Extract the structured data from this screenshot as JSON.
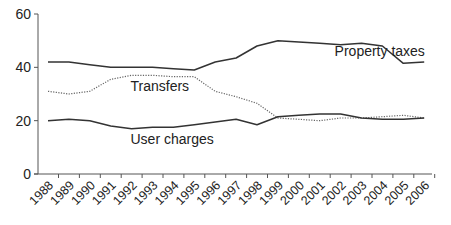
{
  "chart_data": {
    "type": "line",
    "title": "",
    "xlabel": "",
    "ylabel": "",
    "ylim": [
      0,
      60
    ],
    "yticks": [
      0,
      20,
      40,
      60
    ],
    "grid": false,
    "legend": "inline labels",
    "categories": [
      "1988",
      "1989",
      "1990",
      "1991",
      "1992",
      "1993",
      "1994",
      "1995",
      "1996",
      "1997",
      "1998",
      "1999",
      "2000",
      "2001",
      "2002",
      "2003",
      "2004",
      "2005",
      "2006"
    ],
    "series": [
      {
        "name": "Property taxes",
        "style": "solid",
        "values": [
          42,
          42,
          41,
          40,
          40,
          40,
          39.5,
          39,
          42,
          43.5,
          48,
          50,
          49.5,
          49,
          48.5,
          49,
          48,
          41.5,
          42
        ]
      },
      {
        "name": "Transfers",
        "style": "dotted",
        "values": [
          31,
          30,
          31,
          35.5,
          37,
          37,
          36.5,
          36.5,
          31,
          29,
          26.5,
          21,
          20.5,
          20,
          21,
          21,
          21.5,
          22,
          21
        ]
      },
      {
        "name": "User charges",
        "style": "solid",
        "values": [
          20,
          20.5,
          20,
          18,
          17,
          17.5,
          17.5,
          18.5,
          19.5,
          20.5,
          18.5,
          21.5,
          22,
          22.5,
          22.5,
          21,
          20.5,
          20.5,
          21
        ]
      }
    ],
    "annotations": [
      {
        "text": "Property taxes",
        "x_year": "2002",
        "y": 46
      },
      {
        "text": "Transfers",
        "x_year": "1993",
        "y": 33
      },
      {
        "text": "User charges",
        "x_year": "1993",
        "y": 13
      }
    ]
  },
  "colors": {
    "line": "#333333",
    "dotted": "#666666",
    "axis": "#555555",
    "text": "#222222"
  }
}
